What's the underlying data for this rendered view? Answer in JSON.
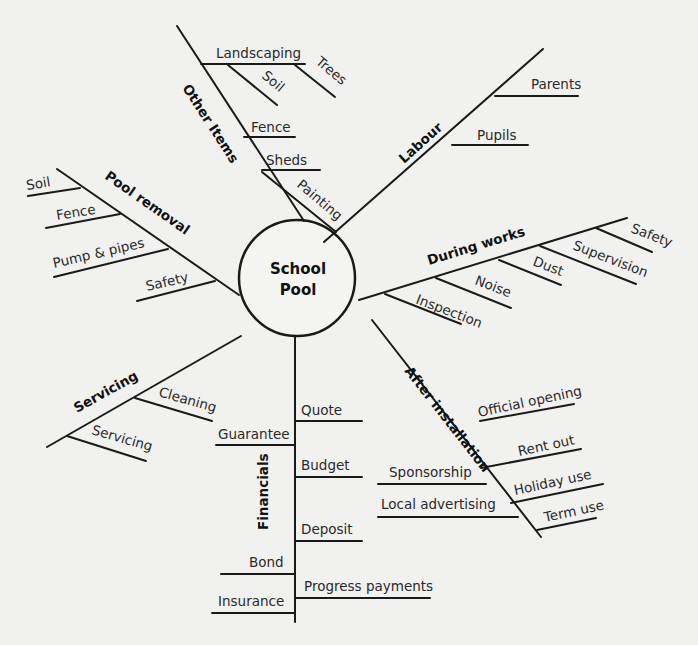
{
  "diagram": {
    "center": {
      "line1": "School",
      "line2": "Pool"
    },
    "colors": {
      "background": "#f1f1ef",
      "ink": "#1a1a1a"
    },
    "branches": {
      "other_items": {
        "label": "Other Items",
        "items": {
          "landscaping": "Landscaping",
          "soil": "Soil",
          "trees": "Trees",
          "fence": "Fence",
          "sheds": "Sheds",
          "painting": "Painting"
        }
      },
      "labour": {
        "label": "Labour",
        "items": {
          "parents": "Parents",
          "pupils": "Pupils"
        }
      },
      "during_works": {
        "label": "During works",
        "items": {
          "safety": "Safety",
          "supervision": "Supervision",
          "dust": "Dust",
          "noise": "Noise",
          "inspection": "Inspection"
        }
      },
      "after_installation": {
        "label": "After installation",
        "items": {
          "official_opening": "Official opening",
          "rent_out": "Rent out",
          "holiday_use": "Holiday use",
          "term_use": "Term use",
          "sponsorship": "Sponsorship",
          "local_advertising": "Local advertising"
        }
      },
      "financials": {
        "label": "Financials",
        "items": {
          "quote": "Quote",
          "guarantee": "Guarantee",
          "budget": "Budget",
          "deposit": "Deposit",
          "bond": "Bond",
          "progress_payments": "Progress payments",
          "insurance": "Insurance"
        }
      },
      "servicing": {
        "label": "Servicing",
        "items": {
          "cleaning": "Cleaning",
          "servicing": "Servicing"
        }
      },
      "pool_removal": {
        "label": "Pool removal",
        "items": {
          "soil": "Soil",
          "fence": "Fence",
          "pump_pipes": "Pump & pipes",
          "safety": "Safety"
        }
      }
    }
  }
}
